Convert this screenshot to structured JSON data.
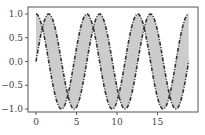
{
  "chart_data": {
    "type": "line",
    "title": "",
    "xlabel": "",
    "ylabel": "",
    "xlim": [
      -1,
      19.8
    ],
    "ylim": [
      -1.1,
      1.1
    ],
    "grid": false,
    "legend": null,
    "x_ticks": [
      0,
      5,
      10,
      15
    ],
    "x_tick_labels": [
      "0",
      "5",
      "10",
      "15"
    ],
    "y_ticks": [
      1.0,
      0.5,
      0.0,
      -0.5,
      -1.0
    ],
    "y_tick_labels": [
      "1.0",
      "0.5",
      "0.0",
      "−0.5",
      "−1.0"
    ],
    "x_domain": [
      0,
      18.85
    ],
    "series": [
      {
        "name": "sin(x)",
        "function": "sin",
        "style": "dashdot",
        "color": "#333333"
      },
      {
        "name": "cos(x)",
        "function": "cos",
        "style": "dashdot",
        "color": "#333333"
      }
    ],
    "fill_between": {
      "between": [
        "sin(x)",
        "cos(x)"
      ],
      "color": "#cccccc"
    },
    "sample_points": {
      "x": [
        0,
        1.57,
        3.14,
        4.71,
        6.28,
        7.85,
        9.42,
        11.0,
        12.57,
        14.14,
        15.71,
        17.28,
        18.85
      ],
      "sin": [
        0,
        1,
        0,
        -1,
        0,
        1,
        0,
        -1,
        0,
        1,
        0,
        -1,
        0
      ],
      "cos": [
        1,
        0,
        -1,
        0,
        1,
        0,
        -1,
        0,
        1,
        0,
        -1,
        0,
        1
      ]
    }
  },
  "colors": {
    "line": "#333333",
    "fill": "#cccccc",
    "axis": "#555555",
    "text": "#444444"
  }
}
